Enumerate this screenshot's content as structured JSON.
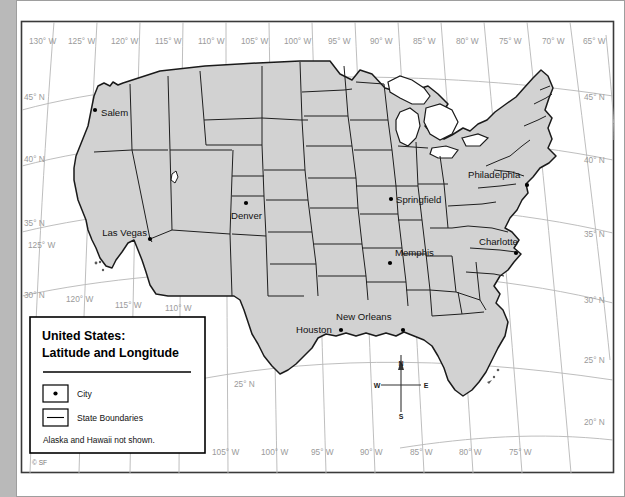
{
  "map": {
    "title_line1": "United States:",
    "title_line2": "Latitude and Longitude",
    "copyright": "© SF",
    "land_color": "#d2d2d2",
    "graticule_color": "#b7b7b7",
    "border_color": "#1a1a1a"
  },
  "legend": {
    "city_label": "City",
    "boundaries_label": "State Boundaries",
    "note": "Alaska and Hawaii not shown."
  },
  "compass": {
    "north": "N",
    "south": "S",
    "east": "E",
    "west": "W"
  },
  "graticule": {
    "top_longitudes": [
      "130° W",
      "125° W",
      "120° W",
      "115° W",
      "110° W",
      "105° W",
      "100° W",
      "95° W",
      "90° W",
      "85° W",
      "80° W",
      "75° W",
      "70° W",
      "65° W"
    ],
    "bottom_longitudes": [
      "120° W",
      "115° W",
      "110° W",
      "105° W",
      "100° W",
      "95° W",
      "90° W",
      "85° W",
      "80° W",
      "75° W"
    ],
    "left_latitudes": [
      "45° N",
      "40° N",
      "35° N",
      "30° N"
    ],
    "left_extra_longitude": "125° W",
    "right_latitudes": [
      "45° N",
      "40° N",
      "35° N",
      "30° N",
      "25° N",
      "20° N"
    ],
    "inner_latitude": "25° N"
  },
  "cities": [
    {
      "name": "Salem",
      "label_x": 101,
      "label_y": 116,
      "dot_x": 95,
      "dot_y": 110,
      "anchor": "start"
    },
    {
      "name": "Las Vegas",
      "label_x": 147,
      "label_y": 236,
      "dot_x": 150,
      "dot_y": 239,
      "anchor": "end"
    },
    {
      "name": "Denver",
      "label_x": 234,
      "label_y": 219,
      "dot_x": 246,
      "dot_y": 203,
      "anchor": "start"
    },
    {
      "name": "Springfield",
      "label_x": 396,
      "label_y": 203,
      "dot_x": 391,
      "dot_y": 199,
      "anchor": "start"
    },
    {
      "name": "Philadelphia",
      "label_x": 468,
      "label_y": 178,
      "dot_x": 524,
      "dot_y": 185,
      "anchor": "start"
    },
    {
      "name": "Charlotte",
      "label_x": 479,
      "label_y": 245,
      "dot_x": 512,
      "dot_y": 250,
      "anchor": "start"
    },
    {
      "name": "Memphis",
      "label_x": 395,
      "label_y": 256,
      "dot_x": 389,
      "dot_y": 262,
      "anchor": "start"
    },
    {
      "name": "New Orleans",
      "label_x": 336,
      "label_y": 320,
      "dot_x": 401,
      "dot_y": 328,
      "anchor": "start"
    },
    {
      "name": "Houston",
      "label_x": 298,
      "label_y": 332,
      "dot_x": 340,
      "dot_y": 330,
      "anchor": "start"
    }
  ]
}
